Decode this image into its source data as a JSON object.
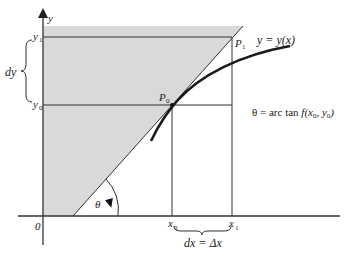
{
  "diagram": {
    "colors": {
      "shade": "#d9d9d9",
      "line": "#333333",
      "curve": "#1a1a1a",
      "text": "#222222"
    },
    "axes": {
      "y_label": "y",
      "origin_label": "0"
    },
    "y_ticks": {
      "y1": "y",
      "y1_sub": "1",
      "y0": "y",
      "y0_sub": "0"
    },
    "x_ticks": {
      "x0": "x",
      "x0_sub": "0",
      "x1": "x",
      "x1_sub": "1"
    },
    "brace_labels": {
      "dy": "dy",
      "dx": "dx = Δx"
    },
    "points": {
      "p0": "P",
      "p0_sub": "0",
      "p1": "P",
      "p1_sub": "1"
    },
    "curve_label": "y = y(x)",
    "angle_label": "θ",
    "equation": {
      "lhs": "θ = arc tan ",
      "f": "f",
      "args_open": "(x",
      "sub0": "0",
      "comma": ", y",
      "sub1": "0",
      "close": ")"
    }
  }
}
